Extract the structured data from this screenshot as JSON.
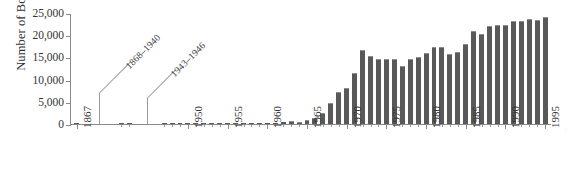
{
  "chart_data": {
    "type": "bar",
    "title": "",
    "subtitle": "",
    "xlabel": "",
    "ylabel": "Number of Boaters",
    "ylim": [
      0,
      25000
    ],
    "ytick_labels": [
      "0",
      "5,000",
      "10,000",
      "15,000",
      "20,000",
      "25,000"
    ],
    "ytick_values": [
      0,
      5000,
      10000,
      15000,
      20000,
      25000
    ],
    "grid": false,
    "legend": null,
    "xtick_labels": [
      "1867",
      "1950",
      "1955",
      "1960",
      "1965",
      "1970",
      "1975",
      "1980",
      "1985",
      "1990",
      "1995"
    ],
    "categories": [
      "1867",
      "1941",
      "1942",
      "1947",
      "1948",
      "1949",
      "1950",
      "1951",
      "1952",
      "1953",
      "1954",
      "1955",
      "1956",
      "1957",
      "1958",
      "1959",
      "1960",
      "1961",
      "1962",
      "1963",
      "1964",
      "1965",
      "1966",
      "1967",
      "1968",
      "1969",
      "1970",
      "1971",
      "1972",
      "1973",
      "1974",
      "1975",
      "1976",
      "1977",
      "1978",
      "1979",
      "1980",
      "1981",
      "1982",
      "1983",
      "1984",
      "1985",
      "1986",
      "1987",
      "1988",
      "1989",
      "1990",
      "1991",
      "1992",
      "1993",
      "1994",
      "1995"
    ],
    "values": [
      60,
      40,
      40,
      50,
      50,
      60,
      80,
      90,
      90,
      100,
      110,
      120,
      130,
      150,
      170,
      200,
      250,
      300,
      450,
      600,
      550,
      900,
      1400,
      2500,
      4700,
      7200,
      8100,
      11700,
      16800,
      15400,
      14800,
      14800,
      14700,
      13100,
      14800,
      15300,
      16100,
      17600,
      17400,
      15800,
      16300,
      18200,
      21200,
      20500,
      22300,
      22400,
      22400,
      23300,
      23400,
      23900,
      23600,
      24400
    ],
    "annotations": [
      {
        "label": "1868–1940",
        "note": "data gap"
      },
      {
        "label": "1943–1946",
        "note": "data gap"
      }
    ],
    "bar_color": "#595959",
    "bar_top_color": "#8d8d8d",
    "axis_color": "#8a8a8a",
    "background": "#ffffff"
  },
  "edge": {
    "mark": "·"
  }
}
